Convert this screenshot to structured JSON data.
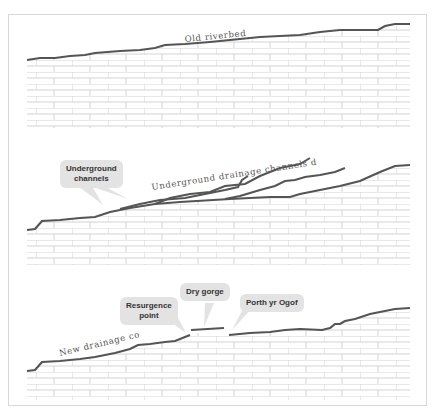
{
  "figure": {
    "panels": [
      {
        "id": "old-riverbed",
        "labels": [
          {
            "text": "Old riverbed",
            "style": "inline-curved"
          }
        ]
      },
      {
        "id": "underground-channels",
        "labels": [
          {
            "text": "Underground drainage channels develop",
            "style": "inline-curved"
          },
          {
            "text": "Underground channels",
            "style": "callout"
          }
        ]
      },
      {
        "id": "new-drainage",
        "labels": [
          {
            "text": "New drainage course",
            "style": "inline-curved"
          },
          {
            "text": "Resurgence point",
            "style": "callout"
          },
          {
            "text": "Dry gorge",
            "style": "callout"
          },
          {
            "text": "Porth yr Ogof",
            "style": "callout"
          }
        ]
      }
    ]
  },
  "labels": {
    "old_riverbed": "Old riverbed",
    "underground_develop": "Underground drainage channels develop",
    "underground_channels_1": "Underground",
    "underground_channels_2": "channels",
    "new_course": "New drainage course",
    "resurgence_1": "Resurgence",
    "resurgence_2": "point",
    "dry_gorge": "Dry gorge",
    "porth": "Porth yr Ogof"
  },
  "colors": {
    "line": "#555555",
    "brick": "#c8c8c8",
    "callout": "#e3e3e3",
    "frame": "#d8d8d8"
  }
}
